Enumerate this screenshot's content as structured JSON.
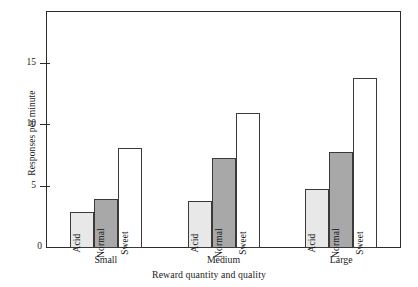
{
  "chart_data": {
    "type": "bar",
    "title": "",
    "xlabel": "Reward quantity and quality",
    "ylabel": "Responses per minute",
    "categories": [
      "Small",
      "Medium",
      "Large"
    ],
    "series": [
      {
        "name": "Acid",
        "values": [
          2.9,
          3.8,
          4.8
        ],
        "color": "#e8e8e8"
      },
      {
        "name": "Normal",
        "values": [
          4.0,
          7.3,
          7.8
        ],
        "color": "#a8a8a8"
      },
      {
        "name": "Sweet",
        "values": [
          8.1,
          10.9,
          13.8
        ],
        "color": "#ffffff"
      }
    ],
    "ylim": [
      0,
      19.1
    ],
    "yticks": [
      0,
      5,
      10,
      15
    ],
    "ytick_labels": [
      "0",
      "5",
      "10",
      "15"
    ],
    "grid": false,
    "legend": "none",
    "bar_labels_inside": true
  },
  "axes": {
    "y_title": "Responses per minute",
    "x_title": "Reward quantity and quality",
    "y_ticks": [
      {
        "value": 15,
        "label": "15"
      },
      {
        "value": 10,
        "label": "10"
      },
      {
        "value": 5,
        "label": "5"
      }
    ],
    "zero_label": "0"
  },
  "groups": [
    {
      "label": "Small",
      "bars": [
        {
          "name": "Acid",
          "label": "Acid",
          "value": 2.9,
          "fill": "#e8e8e8"
        },
        {
          "name": "Normal",
          "label": "Normal",
          "value": 4.0,
          "fill": "#a8a8a8"
        },
        {
          "name": "Sweet",
          "label": "Sweet",
          "value": 8.1,
          "fill": "#ffffff"
        }
      ]
    },
    {
      "label": "Medium",
      "bars": [
        {
          "name": "Acid",
          "label": "Acid",
          "value": 3.8,
          "fill": "#e8e8e8"
        },
        {
          "name": "Normal",
          "label": "Normal",
          "value": 7.3,
          "fill": "#a8a8a8"
        },
        {
          "name": "Sweet",
          "label": "Sweet",
          "value": 10.9,
          "fill": "#ffffff"
        }
      ]
    },
    {
      "label": "Large",
      "bars": [
        {
          "name": "Acid",
          "label": "Acid",
          "value": 4.8,
          "fill": "#e8e8e8"
        },
        {
          "name": "Normal",
          "label": "Normal",
          "value": 7.8,
          "fill": "#a8a8a8"
        },
        {
          "name": "Sweet",
          "label": "Sweet",
          "value": 13.8,
          "fill": "#ffffff"
        }
      ]
    }
  ],
  "colors": {
    "axis": "#2b2b2b",
    "bar_outline": "#3a3a3a",
    "acid_fill": "#e8e8e8",
    "normal_fill": "#a8a8a8",
    "sweet_fill": "#ffffff",
    "background": "#ffffff"
  }
}
